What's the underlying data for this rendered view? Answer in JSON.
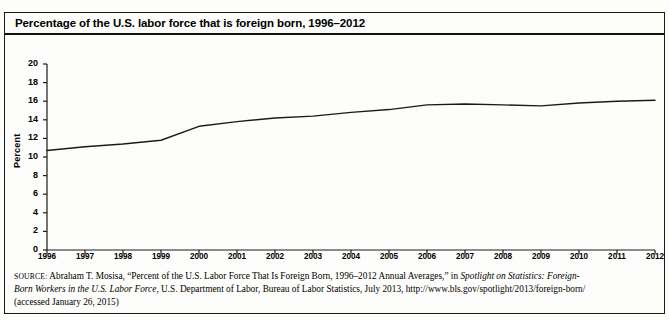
{
  "figure": {
    "title": "Percentage of the U.S. labor force that is foreign born, 1996–2012"
  },
  "source": {
    "label": "SOURCE:",
    "line1_a": " Abraham T. Mosisa, “Percent of the U.S. Labor Force That Is Foreign Born, 1996–2012 Annual Averages,” in ",
    "line1_italic": "Spotlight on Statistics: Foreign-",
    "line2_italic": "Born Workers in the U.S. Labor Force",
    "line2_b": ", U.S. Department of Labor, Bureau of Labor Statistics, July 2013, http://www.bls.gov/spotlight/2013/foreign-born/",
    "line3": "(accessed January 26, 2015)"
  },
  "chart_data": {
    "type": "line",
    "title": "Percentage of the U.S. labor force that is foreign born, 1996–2012",
    "xlabel": "",
    "ylabel": "Percent",
    "ylim": [
      0,
      20
    ],
    "ytick_step": 2,
    "yticks": [
      20,
      18,
      16,
      14,
      12,
      10,
      8,
      6,
      4,
      2,
      0
    ],
    "grid": false,
    "legend": "none",
    "line_color": "#1a1a1a",
    "categories": [
      "1996",
      "1997",
      "1998",
      "1999",
      "2000",
      "2001",
      "2002",
      "2003",
      "2004",
      "2005",
      "2006",
      "2007",
      "2008",
      "2009",
      "2010",
      "2011",
      "2012"
    ],
    "x": [
      1996,
      1997,
      1998,
      1999,
      2000,
      2001,
      2002,
      2003,
      2004,
      2005,
      2006,
      2007,
      2008,
      2009,
      2010,
      2011,
      2012
    ],
    "values": [
      10.7,
      11.1,
      11.4,
      11.8,
      13.3,
      13.8,
      14.2,
      14.4,
      14.8,
      15.1,
      15.6,
      15.7,
      15.6,
      15.5,
      15.8,
      16.0,
      16.1
    ]
  }
}
